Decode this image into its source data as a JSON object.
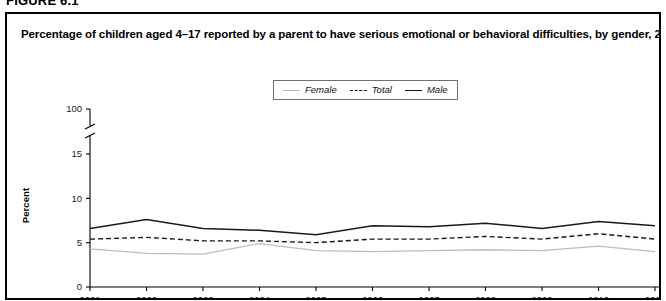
{
  "figure": {
    "number_label": "FIGURE 6.1"
  },
  "chart_title": "Percentage of children aged 4–17 reported by a parent to have serious emotional or behavioral difficulties, by gender, 2001–11",
  "legend": {
    "position": "top-center",
    "entries": [
      {
        "label": "Female",
        "color": "#bdbdbd",
        "style": "solid"
      },
      {
        "label": "Total",
        "color": "#1a1a1a",
        "style": "dashed"
      },
      {
        "label": "Male",
        "color": "#1a1a1a",
        "style": "solid"
      }
    ]
  },
  "axes": {
    "y_label": "Percent",
    "y_ticks": [
      "0",
      "5",
      "10",
      "15",
      "100"
    ],
    "y_break_between": [
      "15",
      "100"
    ],
    "x_ticks": [
      "2001",
      "2002",
      "2003",
      "2004",
      "2005",
      "2006",
      "2007",
      "2008",
      "2009",
      "2010",
      "2011"
    ]
  },
  "chart_data": {
    "type": "line",
    "title": "Percentage of children aged 4–17 reported by a parent to have serious emotional or behavioral difficulties, by gender, 2001–11",
    "xlabel": "",
    "ylabel": "Percent",
    "x": [
      2001,
      2002,
      2003,
      2004,
      2005,
      2006,
      2007,
      2008,
      2009,
      2010,
      2011
    ],
    "categories": [
      "2001",
      "2002",
      "2003",
      "2004",
      "2005",
      "2006",
      "2007",
      "2008",
      "2009",
      "2010",
      "2011"
    ],
    "series": [
      {
        "name": "Male",
        "color": "#1a1a1a",
        "style": "solid",
        "values": [
          6.6,
          7.6,
          6.6,
          6.4,
          5.9,
          6.9,
          6.8,
          7.2,
          6.6,
          7.4,
          6.9
        ]
      },
      {
        "name": "Total",
        "color": "#1a1a1a",
        "style": "dashed",
        "values": [
          5.4,
          5.6,
          5.2,
          5.2,
          5.0,
          5.4,
          5.4,
          5.7,
          5.4,
          6.0,
          5.4
        ]
      },
      {
        "name": "Female",
        "color": "#bdbdbd",
        "style": "solid",
        "values": [
          4.3,
          3.8,
          3.7,
          4.9,
          4.1,
          4.0,
          4.1,
          4.2,
          4.1,
          4.6,
          4.0
        ]
      }
    ],
    "ylim": [
      0,
      16
    ],
    "y_axis_break": true,
    "y_break_top_value": 100,
    "xlim": [
      2001,
      2011
    ],
    "grid": false,
    "legend_position": "top-center"
  }
}
